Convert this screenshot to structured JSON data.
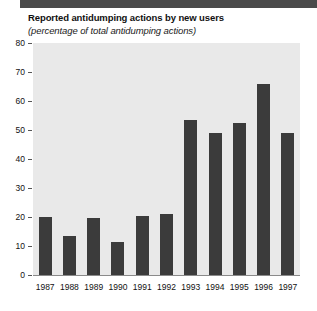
{
  "decor": {
    "top_rule_color": "#4a4a4a"
  },
  "colors": {
    "bar": "#3b3b3b",
    "plot_background": "#e9e9e9",
    "text": "#111111",
    "tick": "#555555"
  },
  "chart_data": {
    "type": "bar",
    "title": "Reported antidumping actions by new users",
    "subtitle": "(percentage of total antidumping actions)",
    "xlabel": "",
    "ylabel": "",
    "ylim": [
      0,
      80
    ],
    "ytick_step": 10,
    "yticks": [
      80,
      70,
      60,
      50,
      40,
      30,
      20,
      10,
      0
    ],
    "grid": false,
    "legend": null,
    "categories": [
      "1987",
      "1988",
      "1989",
      "1990",
      "1991",
      "1992",
      "1993",
      "1994",
      "1995",
      "1996",
      "1997"
    ],
    "values": [
      20,
      13.5,
      19.5,
      11.5,
      20.5,
      21,
      53.5,
      49,
      52.5,
      66,
      49
    ]
  }
}
